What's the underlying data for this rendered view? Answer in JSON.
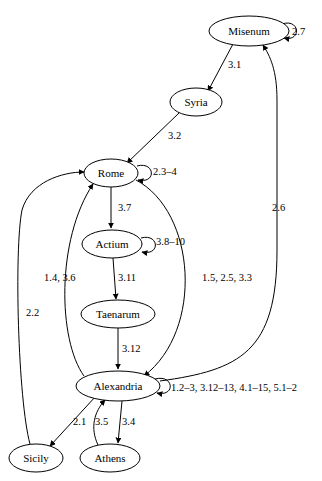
{
  "diagram": {
    "type": "directed-graph",
    "title": "",
    "background_color": "#ffffff",
    "stroke_color": "#000000",
    "node_fill": "#ffffff",
    "nodes": [
      {
        "id": "misenum",
        "label": "Misenum",
        "cx": 249,
        "cy": 31,
        "rx": 40,
        "ry": 15
      },
      {
        "id": "syria",
        "label": "Syria",
        "cx": 196,
        "cy": 102,
        "rx": 26,
        "ry": 14
      },
      {
        "id": "rome",
        "label": "Rome",
        "cx": 111,
        "cy": 173,
        "rx": 27,
        "ry": 14
      },
      {
        "id": "actium",
        "label": "Actium",
        "cx": 112,
        "cy": 244,
        "rx": 30,
        "ry": 14
      },
      {
        "id": "taenarum",
        "label": "Taenarum",
        "cx": 118,
        "cy": 314,
        "rx": 37,
        "ry": 14
      },
      {
        "id": "alexandria",
        "label": "Alexandria",
        "cx": 118,
        "cy": 386,
        "rx": 42,
        "ry": 15
      },
      {
        "id": "sicily",
        "label": "Sicily",
        "cx": 36,
        "cy": 458,
        "rx": 27,
        "ry": 14
      },
      {
        "id": "athens",
        "label": "Athens",
        "cx": 110,
        "cy": 458,
        "rx": 30,
        "ry": 14
      }
    ],
    "edges": [
      {
        "id": "misenum-self",
        "from": "misenum",
        "to": "misenum",
        "label": "2.7",
        "kind": "self-loop"
      },
      {
        "id": "misenum-syria",
        "from": "misenum",
        "to": "syria",
        "label": "3.1",
        "kind": "straight"
      },
      {
        "id": "syria-rome",
        "from": "syria",
        "to": "rome",
        "label": "3.2",
        "kind": "straight"
      },
      {
        "id": "rome-self",
        "from": "rome",
        "to": "rome",
        "label": "2.3–4",
        "kind": "self-loop"
      },
      {
        "id": "rome-actium",
        "from": "rome",
        "to": "actium",
        "label": "3.7",
        "kind": "straight"
      },
      {
        "id": "actium-self",
        "from": "actium",
        "to": "actium",
        "label": "3.8–10",
        "kind": "self-loop"
      },
      {
        "id": "actium-taenarum",
        "from": "actium",
        "to": "taenarum",
        "label": "3.11",
        "kind": "straight"
      },
      {
        "id": "taenarum-alex",
        "from": "taenarum",
        "to": "alexandria",
        "label": "3.12",
        "kind": "straight"
      },
      {
        "id": "alex-rome",
        "from": "alexandria",
        "to": "rome",
        "label": "1.4, 3.6",
        "kind": "curve"
      },
      {
        "id": "rome-alex",
        "from": "rome",
        "to": "alexandria",
        "label": "1.5, 2.5, 3.3",
        "kind": "curve"
      },
      {
        "id": "alex-self",
        "from": "alexandria",
        "to": "alexandria",
        "label": "1.2–3, 3.12–13, 4.1–15, 5.1–2",
        "kind": "self-loop"
      },
      {
        "id": "alex-misenum",
        "from": "alexandria",
        "to": "misenum",
        "label": "2.6",
        "kind": "curve"
      },
      {
        "id": "sicily-rome",
        "from": "sicily",
        "to": "rome",
        "label": "2.2",
        "kind": "curve"
      },
      {
        "id": "alex-sicily",
        "from": "alexandria",
        "to": "sicily",
        "label": "2.1",
        "kind": "straight"
      },
      {
        "id": "athens-alex",
        "from": "athens",
        "to": "alexandria",
        "label": "3.5",
        "kind": "curve"
      },
      {
        "id": "alex-athens",
        "from": "alexandria",
        "to": "athens",
        "label": "3.4",
        "kind": "straight"
      }
    ],
    "edge_labels": {
      "misenum_self": {
        "text": "2.7",
        "x": 292,
        "y": 33
      },
      "misenum_syria": {
        "text": "3.1",
        "x": 228,
        "y": 66
      },
      "syria_rome": {
        "text": "3.2",
        "x": 168,
        "y": 137
      },
      "rome_self": {
        "text": "2.3–4",
        "x": 153,
        "y": 173
      },
      "rome_actium": {
        "text": "3.7",
        "x": 120,
        "y": 209
      },
      "actium_self": {
        "text": "3.8–10",
        "x": 156,
        "y": 243
      },
      "actium_taen": {
        "text": "3.11",
        "x": 120,
        "y": 279
      },
      "alex_rome": {
        "text": "1.4, 3.6",
        "x": 70,
        "y": 279
      },
      "rome_alex": {
        "text": "1.5, 2.5, 3.3",
        "x": 202,
        "y": 279
      },
      "taen_alex": {
        "text": "3.12",
        "x": 124,
        "y": 350
      },
      "alex_self": {
        "text": "1.2–3, 3.12–13, 4.1–15, 5.1–2",
        "x": 172,
        "y": 388
      },
      "alex_misenum": {
        "text": "2.6",
        "x": 277,
        "y": 209
      },
      "sicily_rome": {
        "text": "2.2",
        "x": 33,
        "y": 314
      },
      "alex_sicily": {
        "text": "2.1",
        "x": 84,
        "y": 423
      },
      "athens_alex": {
        "text": "3.5",
        "x": 105,
        "y": 423
      },
      "alex_athens": {
        "text": "3.4",
        "x": 130,
        "y": 423
      }
    }
  }
}
